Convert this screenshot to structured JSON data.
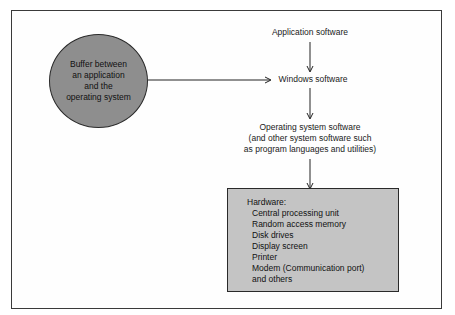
{
  "diagram": {
    "type": "flow",
    "buffer_node": {
      "label": "Buffer between\nan application\nand the\noperating system",
      "shape": "circle",
      "fill": "#8e8e8e"
    },
    "nodes": [
      {
        "id": "application",
        "label": "Application software"
      },
      {
        "id": "windows",
        "label": "Windows software"
      },
      {
        "id": "os",
        "label": "Operating system software\n(and other system software such\nas program languages and utilities)"
      }
    ],
    "hardware": {
      "title": "Hardware:",
      "items": [
        "Central processing unit",
        "Random access memory",
        "Disk drives",
        "Display screen",
        "Printer",
        "Modem (Communication port)",
        "and others"
      ],
      "fill": "#c4c4c4"
    },
    "edges": [
      {
        "from": "buffer",
        "to": "windows"
      },
      {
        "from": "application",
        "to": "windows"
      },
      {
        "from": "windows",
        "to": "os"
      },
      {
        "from": "os",
        "to": "hardware"
      }
    ]
  }
}
